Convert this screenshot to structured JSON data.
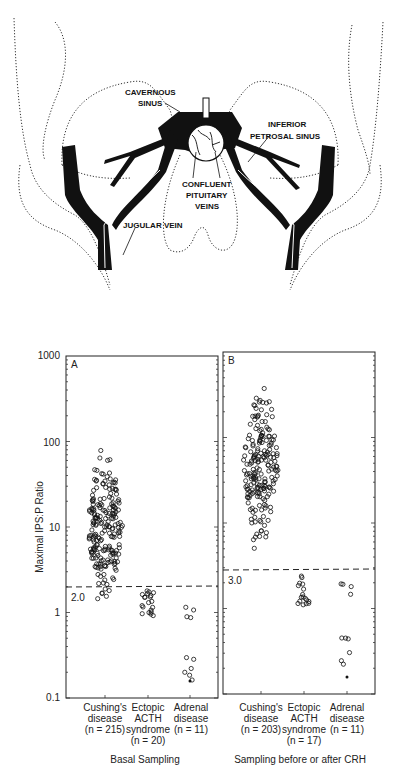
{
  "anatomy": {
    "labels": {
      "cavernous_1": "CAVERNOUS",
      "cavernous_2": "SINUS",
      "inferior_1": "INFERIOR",
      "inferior_2": "PETROSAL SINUS",
      "confluent_1": "CONFLUENT",
      "confluent_2": "PITUITARY",
      "confluent_3": "VEINS",
      "jugular": "JUGULAR VEIN"
    }
  },
  "chart_data": [
    {
      "type": "scatter",
      "panel": "A",
      "title": "Basal Sampling",
      "ylabel": "Maximal IPS:P Ratio",
      "yscale": "log",
      "ylim": [
        0.1,
        1000
      ],
      "yticks": [
        "1000",
        "100",
        "10",
        "1",
        "0.1"
      ],
      "categories": [
        "Cushing's disease (n = 215)",
        "Ectopic ACTH syndrome (n = 20)",
        "Adrenal disease (n = 11)"
      ],
      "threshold": {
        "value": 2.0,
        "label": "2.0"
      },
      "series": [
        {
          "name": "Cushing's disease",
          "n": 215,
          "range": [
            0.9,
            130
          ]
        },
        {
          "name": "Ectopic ACTH syndrome",
          "n": 20,
          "range": [
            0.9,
            1.8
          ]
        },
        {
          "name": "Adrenal disease",
          "n": 11,
          "range": [
            0.16,
            1.3
          ]
        }
      ]
    },
    {
      "type": "scatter",
      "panel": "B",
      "title": "Sampling before or after CRH",
      "ylabel": "Maximal IPS:P Ratio",
      "yscale": "log",
      "ylim": [
        0.1,
        1000
      ],
      "categories": [
        "Cushing's disease (n = 203)",
        "Ectopic ACTH syndrome (n = 17)",
        "Adrenal disease (n = 11)"
      ],
      "threshold": {
        "value": 3.0,
        "label": "3.0"
      },
      "series": [
        {
          "name": "Cushing's disease",
          "n": 203,
          "range": [
            3.3,
            700
          ]
        },
        {
          "name": "Ectopic ACTH syndrome",
          "n": 17,
          "range": [
            1.1,
            2.4
          ]
        },
        {
          "name": "Adrenal disease",
          "n": 11,
          "range": [
            0.16,
            2.0
          ]
        }
      ]
    }
  ],
  "panelA": {
    "letter": "A",
    "threshold_label": "2.0",
    "cat1": [
      "Cushing's",
      "disease",
      "(n = 215)"
    ],
    "cat2": [
      "Ectopic",
      "ACTH",
      "syndrome",
      "(n = 20)"
    ],
    "cat3": [
      "Adrenal",
      "disease",
      "(n = 11)"
    ],
    "caption": "Basal Sampling"
  },
  "panelB": {
    "letter": "B",
    "threshold_label": "3.0",
    "cat1": [
      "Cushing's",
      "disease",
      "(n = 203)"
    ],
    "cat2": [
      "Ectopic",
      "ACTH",
      "syndrome",
      "(n = 17)"
    ],
    "cat3": [
      "Adrenal",
      "disease",
      "(n = 11)"
    ],
    "caption": "Sampling before or after CRH"
  },
  "axis": {
    "ylabel": "Maximal IPS:P Ratio",
    "ticks": [
      "1000",
      "100",
      "10",
      "1",
      "0.1"
    ]
  }
}
